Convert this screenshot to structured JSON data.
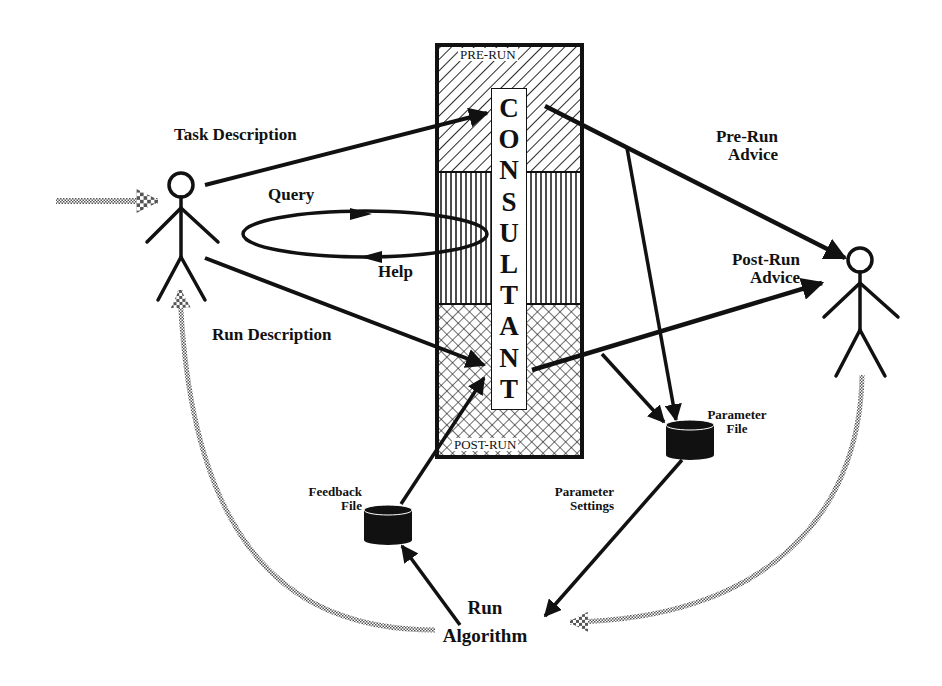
{
  "consultant": {
    "title_letters": [
      "C",
      "O",
      "N",
      "S",
      "U",
      "L",
      "T",
      "A",
      "N",
      "T"
    ],
    "sections": {
      "pre_run": "PRE-RUN",
      "post_run": "POST-RUN"
    }
  },
  "labels": {
    "task_description": "Task Description",
    "query": "Query",
    "help": "Help",
    "run_description": "Run Description",
    "pre_run_advice_line1": "Pre-Run",
    "pre_run_advice_line2": "Advice",
    "post_run_advice_line1": "Post-Run",
    "post_run_advice_line2": "Advice",
    "parameter_file_line1": "Parameter",
    "parameter_file_line2": "File",
    "feedback_file_line1": "Feedback",
    "feedback_file_line2": "File",
    "parameter_settings_line1": "Parameter",
    "parameter_settings_line2": "Settings",
    "run_algorithm_line1": "Run",
    "run_algorithm_line2": "Algorithm"
  },
  "colors": {
    "ink": "#111111",
    "dotted_arrow": "#9a9a9a",
    "background": "#ffffff"
  }
}
